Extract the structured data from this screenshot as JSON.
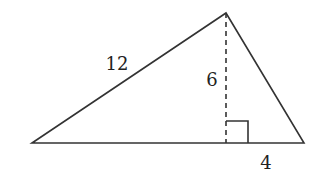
{
  "diagram": {
    "type": "triangle-with-altitude",
    "stroke_color": "#333333",
    "background": "#ffffff",
    "vertices": {
      "left": [
        32,
        143
      ],
      "apex": [
        226,
        13
      ],
      "right": [
        304,
        143
      ]
    },
    "altitude": {
      "from": [
        226,
        13
      ],
      "foot": [
        226,
        143
      ],
      "style": "dashed",
      "right_angle_marker": {
        "x": 226,
        "y": 121,
        "size": 22
      }
    },
    "labels": {
      "left_side": {
        "text": "12",
        "x": 117,
        "y": 64
      },
      "height": {
        "text": "6",
        "x": 212,
        "y": 80
      },
      "base_right_segment": {
        "text": "4",
        "x": 266,
        "y": 163
      }
    }
  }
}
